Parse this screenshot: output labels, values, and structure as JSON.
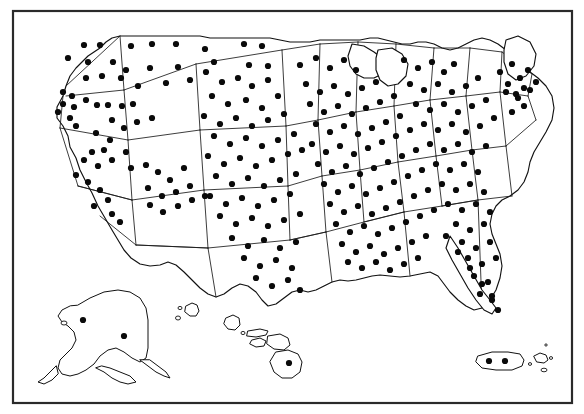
{
  "figure": {
    "background_color": "#ffffff",
    "ink_color": "#111111",
    "dot_color": "#0a0a0a",
    "frame_color": "#2a2a2a"
  },
  "frame": {
    "x": 13,
    "y": 11,
    "width": 559,
    "height": 392,
    "stroke_width": 2.2
  },
  "chart_data": {
    "type": "scatter",
    "xlabel": "",
    "ylabel": "",
    "projection": "albers-usa",
    "grid": false,
    "legend": "none",
    "dot_radius": 3.1,
    "total_dots": 268,
    "regions": [
      {
        "name": "Contiguous United States",
        "dots": 252
      },
      {
        "name": "Alaska",
        "dots": 2
      },
      {
        "name": "Hawaii",
        "dots": 1
      },
      {
        "name": "Puerto Rico",
        "dots": 2
      }
    ],
    "points": [
      [
        84,
        45
      ],
      [
        100,
        45
      ],
      [
        68,
        58
      ],
      [
        88,
        62
      ],
      [
        113,
        62
      ],
      [
        131,
        46
      ],
      [
        152,
        44
      ],
      [
        176,
        44
      ],
      [
        205,
        49
      ],
      [
        126,
        70
      ],
      [
        150,
        68
      ],
      [
        178,
        67
      ],
      [
        214,
        62
      ],
      [
        244,
        44
      ],
      [
        249,
        65
      ],
      [
        262,
        46
      ],
      [
        268,
        66
      ],
      [
        86,
        78
      ],
      [
        102,
        76
      ],
      [
        121,
        78
      ],
      [
        138,
        86
      ],
      [
        166,
        83
      ],
      [
        190,
        80
      ],
      [
        63,
        92
      ],
      [
        72,
        96
      ],
      [
        63,
        104
      ],
      [
        74,
        107
      ],
      [
        58,
        112
      ],
      [
        70,
        118
      ],
      [
        76,
        126
      ],
      [
        86,
        100
      ],
      [
        97,
        105
      ],
      [
        108,
        105
      ],
      [
        122,
        106
      ],
      [
        133,
        104
      ],
      [
        112,
        120
      ],
      [
        124,
        128
      ],
      [
        137,
        122
      ],
      [
        152,
        118
      ],
      [
        96,
        133
      ],
      [
        110,
        140
      ],
      [
        104,
        150
      ],
      [
        92,
        152
      ],
      [
        84,
        160
      ],
      [
        98,
        166
      ],
      [
        112,
        160
      ],
      [
        126,
        152
      ],
      [
        76,
        175
      ],
      [
        88,
        182
      ],
      [
        100,
        190
      ],
      [
        108,
        200
      ],
      [
        94,
        206
      ],
      [
        112,
        214
      ],
      [
        120,
        222
      ],
      [
        131,
        168
      ],
      [
        146,
        165
      ],
      [
        158,
        172
      ],
      [
        170,
        180
      ],
      [
        184,
        168
      ],
      [
        148,
        188
      ],
      [
        162,
        196
      ],
      [
        176,
        192
      ],
      [
        190,
        186
      ],
      [
        150,
        205
      ],
      [
        163,
        212
      ],
      [
        178,
        206
      ],
      [
        192,
        200
      ],
      [
        205,
        196
      ],
      [
        206,
        72
      ],
      [
        222,
        82
      ],
      [
        238,
        78
      ],
      [
        252,
        86
      ],
      [
        268,
        80
      ],
      [
        212,
        96
      ],
      [
        228,
        104
      ],
      [
        246,
        100
      ],
      [
        262,
        108
      ],
      [
        278,
        96
      ],
      [
        204,
        116
      ],
      [
        220,
        124
      ],
      [
        236,
        118
      ],
      [
        252,
        126
      ],
      [
        268,
        120
      ],
      [
        284,
        114
      ],
      [
        214,
        136
      ],
      [
        230,
        144
      ],
      [
        246,
        138
      ],
      [
        262,
        146
      ],
      [
        278,
        140
      ],
      [
        294,
        134
      ],
      [
        208,
        156
      ],
      [
        224,
        164
      ],
      [
        240,
        158
      ],
      [
        256,
        166
      ],
      [
        272,
        160
      ],
      [
        288,
        154
      ],
      [
        302,
        150
      ],
      [
        216,
        176
      ],
      [
        232,
        184
      ],
      [
        248,
        178
      ],
      [
        264,
        186
      ],
      [
        280,
        180
      ],
      [
        296,
        174
      ],
      [
        210,
        196
      ],
      [
        226,
        204
      ],
      [
        242,
        198
      ],
      [
        258,
        206
      ],
      [
        274,
        200
      ],
      [
        290,
        194
      ],
      [
        220,
        216
      ],
      [
        236,
        224
      ],
      [
        252,
        218
      ],
      [
        268,
        226
      ],
      [
        284,
        220
      ],
      [
        300,
        214
      ],
      [
        232,
        238
      ],
      [
        248,
        246
      ],
      [
        264,
        240
      ],
      [
        280,
        248
      ],
      [
        296,
        242
      ],
      [
        244,
        258
      ],
      [
        260,
        266
      ],
      [
        276,
        260
      ],
      [
        292,
        268
      ],
      [
        256,
        278
      ],
      [
        272,
        286
      ],
      [
        288,
        280
      ],
      [
        300,
        290
      ],
      [
        300,
        65
      ],
      [
        316,
        58
      ],
      [
        330,
        68
      ],
      [
        344,
        60
      ],
      [
        356,
        70
      ],
      [
        306,
        84
      ],
      [
        320,
        92
      ],
      [
        334,
        86
      ],
      [
        348,
        94
      ],
      [
        362,
        88
      ],
      [
        376,
        82
      ],
      [
        310,
        104
      ],
      [
        324,
        112
      ],
      [
        338,
        106
      ],
      [
        352,
        114
      ],
      [
        366,
        108
      ],
      [
        380,
        102
      ],
      [
        394,
        96
      ],
      [
        316,
        124
      ],
      [
        330,
        132
      ],
      [
        344,
        126
      ],
      [
        358,
        134
      ],
      [
        372,
        128
      ],
      [
        386,
        122
      ],
      [
        400,
        116
      ],
      [
        312,
        144
      ],
      [
        326,
        152
      ],
      [
        340,
        146
      ],
      [
        354,
        154
      ],
      [
        368,
        148
      ],
      [
        382,
        142
      ],
      [
        396,
        136
      ],
      [
        410,
        130
      ],
      [
        318,
        164
      ],
      [
        332,
        172
      ],
      [
        346,
        166
      ],
      [
        360,
        174
      ],
      [
        374,
        168
      ],
      [
        388,
        162
      ],
      [
        402,
        156
      ],
      [
        416,
        150
      ],
      [
        324,
        184
      ],
      [
        338,
        192
      ],
      [
        352,
        186
      ],
      [
        366,
        194
      ],
      [
        380,
        188
      ],
      [
        394,
        182
      ],
      [
        408,
        176
      ],
      [
        422,
        170
      ],
      [
        330,
        204
      ],
      [
        344,
        212
      ],
      [
        358,
        206
      ],
      [
        372,
        214
      ],
      [
        386,
        208
      ],
      [
        400,
        202
      ],
      [
        414,
        196
      ],
      [
        428,
        190
      ],
      [
        336,
        224
      ],
      [
        350,
        232
      ],
      [
        364,
        226
      ],
      [
        378,
        234
      ],
      [
        392,
        228
      ],
      [
        406,
        222
      ],
      [
        420,
        216
      ],
      [
        434,
        210
      ],
      [
        342,
        244
      ],
      [
        356,
        252
      ],
      [
        370,
        246
      ],
      [
        384,
        254
      ],
      [
        398,
        248
      ],
      [
        412,
        242
      ],
      [
        426,
        236
      ],
      [
        348,
        262
      ],
      [
        362,
        268
      ],
      [
        376,
        262
      ],
      [
        390,
        270
      ],
      [
        404,
        264
      ],
      [
        418,
        258
      ],
      [
        404,
        60
      ],
      [
        418,
        68
      ],
      [
        432,
        62
      ],
      [
        444,
        72
      ],
      [
        454,
        64
      ],
      [
        410,
        84
      ],
      [
        424,
        90
      ],
      [
        438,
        84
      ],
      [
        452,
        92
      ],
      [
        466,
        86
      ],
      [
        478,
        78
      ],
      [
        416,
        104
      ],
      [
        430,
        110
      ],
      [
        444,
        104
      ],
      [
        458,
        112
      ],
      [
        472,
        106
      ],
      [
        486,
        100
      ],
      [
        424,
        124
      ],
      [
        438,
        130
      ],
      [
        452,
        124
      ],
      [
        466,
        132
      ],
      [
        480,
        126
      ],
      [
        494,
        118
      ],
      [
        430,
        144
      ],
      [
        444,
        150
      ],
      [
        458,
        144
      ],
      [
        472,
        152
      ],
      [
        486,
        146
      ],
      [
        436,
        164
      ],
      [
        450,
        170
      ],
      [
        464,
        164
      ],
      [
        478,
        172
      ],
      [
        442,
        184
      ],
      [
        456,
        190
      ],
      [
        470,
        184
      ],
      [
        484,
        192
      ],
      [
        448,
        204
      ],
      [
        462,
        210
      ],
      [
        476,
        204
      ],
      [
        490,
        212
      ],
      [
        456,
        224
      ],
      [
        470,
        230
      ],
      [
        484,
        224
      ],
      [
        462,
        242
      ],
      [
        476,
        248
      ],
      [
        490,
        242
      ],
      [
        468,
        258
      ],
      [
        482,
        264
      ],
      [
        496,
        258
      ],
      [
        474,
        276
      ],
      [
        488,
        282
      ],
      [
        480,
        294
      ],
      [
        492,
        300
      ],
      [
        500,
        72
      ],
      [
        512,
        64
      ],
      [
        520,
        78
      ],
      [
        528,
        70
      ],
      [
        536,
        82
      ],
      [
        506,
        92
      ],
      [
        518,
        98
      ],
      [
        530,
        90
      ],
      [
        512,
        112
      ],
      [
        524,
        106
      ],
      [
        446,
        236
      ],
      [
        458,
        252
      ],
      [
        470,
        268
      ],
      [
        482,
        284
      ],
      [
        492,
        296
      ],
      [
        498,
        310
      ],
      [
        508,
        84
      ],
      [
        516,
        94
      ],
      [
        524,
        88
      ]
    ]
  },
  "insets": [
    {
      "name": "alaska",
      "label": "Alaska",
      "dot_count": 2
    },
    {
      "name": "hawaii",
      "label": "Hawaii",
      "dot_count": 1
    },
    {
      "name": "puerto-rico",
      "label": "Puerto Rico",
      "dot_count": 2
    }
  ]
}
